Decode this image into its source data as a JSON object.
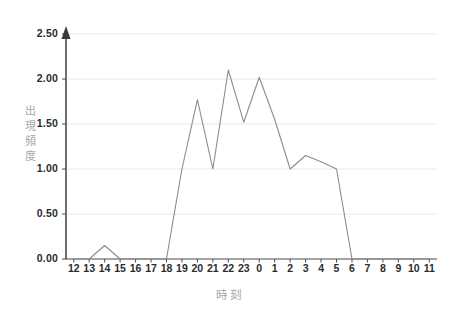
{
  "chart_data": {
    "type": "line",
    "title": "",
    "xlabel": "時刻",
    "ylabel": "出現頻度",
    "categories": [
      "12",
      "13",
      "14",
      "15",
      "16",
      "17",
      "18",
      "19",
      "20",
      "21",
      "22",
      "23",
      "0",
      "1",
      "2",
      "3",
      "4",
      "5",
      "6",
      "7",
      "8",
      "9",
      "10",
      "11"
    ],
    "values": [
      0.0,
      0.0,
      0.15,
      0.0,
      0.0,
      0.0,
      0.0,
      1.0,
      1.77,
      1.0,
      2.1,
      1.52,
      2.02,
      1.55,
      1.0,
      1.15,
      1.08,
      1.0,
      0.0,
      0.0,
      0.0,
      0.0,
      0.0,
      0.0
    ],
    "ylim": [
      0.0,
      2.5
    ],
    "ytick_labels": [
      "0.00",
      "0.50",
      "1.00",
      "1.50",
      "2.00",
      "2.50"
    ],
    "ytick_values": [
      0.0,
      0.5,
      1.0,
      1.5,
      2.0,
      2.5
    ],
    "grid": true,
    "legend": "none",
    "line_color": "#8c8c8c",
    "grid_color": "#e8e8e8",
    "axis_color": "#4a4a4a",
    "label_color": "#a8a8a8",
    "tick_text_color": "#2b2b2b"
  }
}
